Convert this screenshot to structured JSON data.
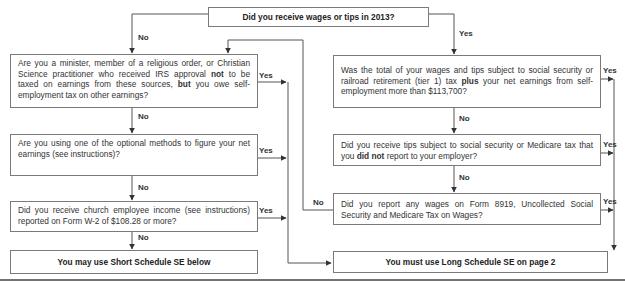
{
  "start": {
    "question": "Did you receive wages or tips in 2013?"
  },
  "left_column": {
    "q1": {
      "pre": "Are you a minister, member of a religious order, or Christian Science practitioner who received IRS approval ",
      "bold1": "not",
      "mid": " to be taxed on earnings from these sources, ",
      "bold2": "but",
      "post": " you owe self-employment tax on other earnings?"
    },
    "q2": {
      "text": "Are you using one of the optional methods to figure your net earnings (see instructions)?"
    },
    "q3": {
      "text": "Did you receive church employee income (see instructions) reported on Form W-2 of $108.28 or more?"
    },
    "result": {
      "text": "You may use Short Schedule SE below"
    }
  },
  "right_column": {
    "q1": {
      "pre": "Was the total of your wages and tips subject to social security or railroad retirement (tier 1) tax ",
      "bold": "plus",
      "post": " your net earnings from self-employment more than $113,700?"
    },
    "q2": {
      "pre": "Did you receive tips subject to social security or Medicare tax that you ",
      "bold": "did not",
      "post": " report to your employer?"
    },
    "q3": {
      "text": "Did you report any wages on Form 8919, Uncollected Social Security and Medicare Tax on Wages?"
    },
    "result": {
      "text": "You must use Long Schedule SE on page 2"
    }
  },
  "labels": {
    "yes": "Yes",
    "no": "No"
  }
}
